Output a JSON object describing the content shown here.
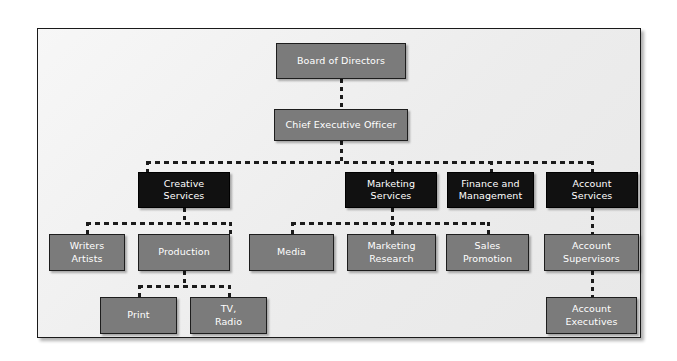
{
  "diagram": {
    "type": "organizational-chart",
    "palette": {
      "page_background": "#ffffff",
      "panel_background": "#ededed",
      "panel_border": "#1a1a1a",
      "node_gray": "#7b7b7b",
      "node_black": "#111111",
      "node_text": "#ffffff",
      "connector": "#1b1b1b"
    },
    "connector_style": "dashed"
  },
  "nodes": {
    "board": {
      "line1": "Board of Directors",
      "line2": ""
    },
    "ceo": {
      "line1": "Chief Executive Officer",
      "line2": ""
    },
    "creative_services": {
      "line1": "Creative",
      "line2": "Services"
    },
    "marketing_services": {
      "line1": "Marketing",
      "line2": "Services"
    },
    "finance_management": {
      "line1": "Finance and",
      "line2": "Management"
    },
    "account_services": {
      "line1": "Account",
      "line2": "Services"
    },
    "writers_artists": {
      "line1": "Writers",
      "line2": "Artists"
    },
    "production": {
      "line1": "Production",
      "line2": ""
    },
    "media": {
      "line1": "Media",
      "line2": ""
    },
    "marketing_research": {
      "line1": "Marketing",
      "line2": "Research"
    },
    "sales_promotion": {
      "line1": "Sales",
      "line2": "Promotion"
    },
    "account_supervisors": {
      "line1": "Account",
      "line2": "Supervisors"
    },
    "print": {
      "line1": "Print",
      "line2": ""
    },
    "tv_radio": {
      "line1": "TV,",
      "line2": "Radio"
    },
    "account_executives": {
      "line1": "Account",
      "line2": "Executives"
    }
  },
  "hierarchy": [
    {
      "id": "board",
      "level": 1,
      "parent": null
    },
    {
      "id": "ceo",
      "level": 2,
      "parent": "board"
    },
    {
      "id": "creative_services",
      "level": 3,
      "parent": "ceo"
    },
    {
      "id": "marketing_services",
      "level": 3,
      "parent": "ceo"
    },
    {
      "id": "finance_management",
      "level": 3,
      "parent": "ceo"
    },
    {
      "id": "account_services",
      "level": 3,
      "parent": "ceo"
    },
    {
      "id": "writers_artists",
      "level": 4,
      "parent": "creative_services"
    },
    {
      "id": "production",
      "level": 4,
      "parent": "creative_services"
    },
    {
      "id": "media",
      "level": 4,
      "parent": "marketing_services"
    },
    {
      "id": "marketing_research",
      "level": 4,
      "parent": "marketing_services"
    },
    {
      "id": "sales_promotion",
      "level": 4,
      "parent": "marketing_services"
    },
    {
      "id": "account_supervisors",
      "level": 4,
      "parent": "account_services"
    },
    {
      "id": "print",
      "level": 5,
      "parent": "production"
    },
    {
      "id": "tv_radio",
      "level": 5,
      "parent": "production"
    },
    {
      "id": "account_executives",
      "level": 5,
      "parent": "account_supervisors"
    }
  ]
}
